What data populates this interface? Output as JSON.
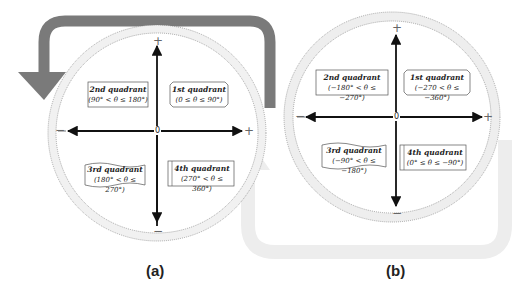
{
  "figure": {
    "panels": [
      {
        "id": "a",
        "caption": "(a)",
        "direction": "counter-clockwise (positive angles)",
        "arrow_color": "#7a7a7a",
        "axis_signs": {
          "top": "+",
          "bottom": "−",
          "left": "−",
          "right": "+"
        },
        "origin_label": "0",
        "quadrants": [
          {
            "name": "1st quadrant",
            "range": "(0 ≤ θ ≤ 90°)"
          },
          {
            "name": "2nd quadrant",
            "range": "(90° < θ ≤ 180°)"
          },
          {
            "name": "3rd quadrant",
            "range": "(180° < θ ≤ 270°)"
          },
          {
            "name": "4th quadrant",
            "range": "(270° < θ ≤ 360°)"
          }
        ]
      },
      {
        "id": "b",
        "caption": "(b)",
        "direction": "clockwise (negative angles)",
        "arrow_color": "#ededed",
        "axis_signs": {
          "top": "+",
          "bottom": "−",
          "left": "−",
          "right": "+"
        },
        "origin_label": "0",
        "quadrants": [
          {
            "name": "1st quadrant",
            "range": "(−270 < θ ≤ −360°)"
          },
          {
            "name": "2nd quadrant",
            "range": "(−180° < θ ≤ −270°)"
          },
          {
            "name": "3rd quadrant",
            "range": "(−90° < θ ≤ −180°)"
          },
          {
            "name": "4th quadrant",
            "range": "(0° ≤ θ ≤ −90°)"
          }
        ]
      }
    ]
  }
}
